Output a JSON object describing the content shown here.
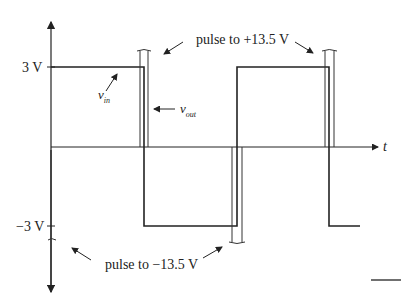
{
  "figure": {
    "type": "waveform-diagram",
    "y_axis": {
      "ticks": [
        {
          "label": "3 V",
          "value": 3
        },
        {
          "label": "−3 V",
          "value": -3
        }
      ]
    },
    "x_axis": {
      "label": "t"
    },
    "signals": [
      {
        "name": "v_in",
        "label_main": "v",
        "label_sub": "in",
        "levels_V": [
          3,
          -3,
          3,
          -3
        ]
      },
      {
        "name": "v_out",
        "label_main": "v",
        "label_sub": "out",
        "spike_levels_V": [
          13.5,
          -13.5,
          13.5
        ]
      }
    ],
    "annotations": {
      "pulse_positive": "pulse to +13.5 V",
      "pulse_negative": "pulse to −13.5 V"
    },
    "colors": {
      "line": "#222222",
      "background": "#ffffff"
    }
  }
}
